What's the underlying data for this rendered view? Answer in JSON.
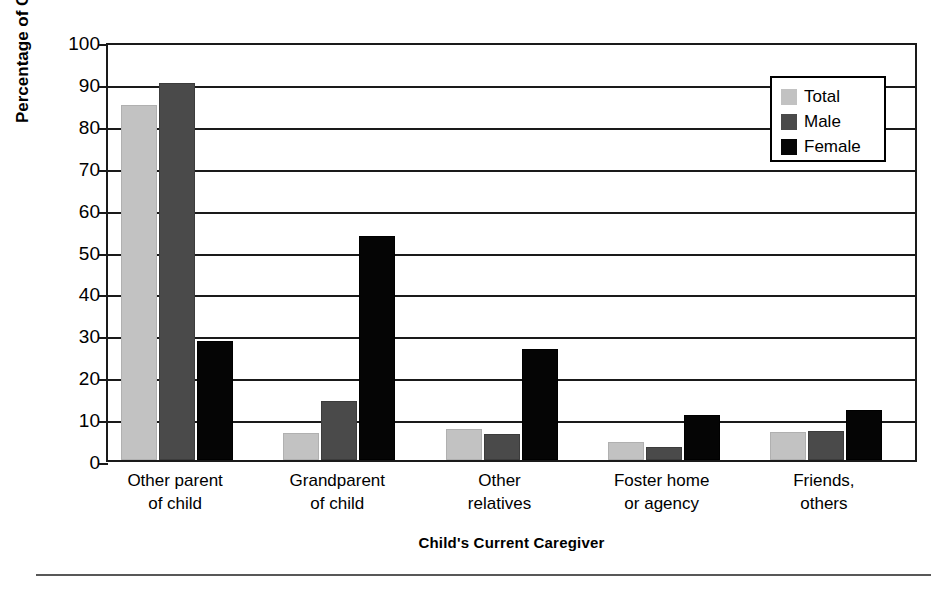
{
  "chart_data": {
    "type": "bar",
    "title": "",
    "xlabel": "Child's Current Caregiver",
    "ylabel": "Percentage of Children",
    "ylim": [
      0,
      100
    ],
    "ytick_step": 10,
    "yticks": [
      0,
      10,
      20,
      30,
      40,
      50,
      60,
      70,
      80,
      90,
      100
    ],
    "ytick_labels": [
      "0",
      "10",
      "20",
      "30",
      "40",
      "50",
      "60",
      "70",
      "80",
      "90",
      "100"
    ],
    "grid": "horizontal",
    "legend_position": "top-right",
    "categories": [
      "Other parent\nof child",
      "Grandparent\nof child",
      "Other\nrelatives",
      "Foster home\nor agency",
      "Friends,\nothers"
    ],
    "category_lines": [
      [
        "Other parent",
        "of child"
      ],
      [
        "Grandparent",
        "of child"
      ],
      [
        "Other",
        "relatives"
      ],
      [
        "Foster home",
        "or agency"
      ],
      [
        "Friends,",
        "others"
      ]
    ],
    "series": [
      {
        "name": "Total",
        "color": "#c2c2c2",
        "values": [
          84.7,
          6.5,
          7.4,
          4.3,
          6.8
        ]
      },
      {
        "name": "Male",
        "color": "#4a4a4a",
        "values": [
          90.0,
          14.0,
          6.2,
          3.1,
          7.0
        ]
      },
      {
        "name": "Female",
        "color": "#050505",
        "values": [
          28.5,
          53.5,
          26.6,
          10.8,
          11.9
        ]
      }
    ]
  },
  "legend": {
    "items": [
      {
        "label": "Total",
        "swatch": "total"
      },
      {
        "label": "Male",
        "swatch": "male"
      },
      {
        "label": "Female",
        "swatch": "female"
      }
    ]
  },
  "axes": {
    "y_title": "Percentage of Children",
    "x_title": "Child's Current Caregiver"
  }
}
